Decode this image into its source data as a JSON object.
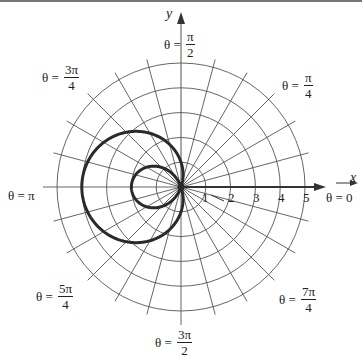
{
  "chart_data": {
    "type": "line",
    "subtype": "polar",
    "title": "",
    "equation": "r = 1 - 3cos(θ)",
    "curve": "limaçon with inner loop",
    "xlabel": "x",
    "ylabel": "y",
    "radial_ticks": [
      "1",
      "2",
      "3",
      "4",
      "5"
    ],
    "rlim": [
      0,
      5
    ],
    "grid": true,
    "grid_circles": [
      1,
      2,
      3,
      4,
      5
    ],
    "grid_radial_step_deg": 15,
    "angle_labels": [
      {
        "key": "zero",
        "text": "θ = 0",
        "num": "",
        "den": ""
      },
      {
        "key": "pi_4",
        "text": "θ =",
        "num": "π",
        "den": "4"
      },
      {
        "key": "pi_2",
        "text": "θ =",
        "num": "π",
        "den": "2"
      },
      {
        "key": "three_pi_4",
        "text": "θ =",
        "num": "3π",
        "den": "4"
      },
      {
        "key": "pi",
        "text": "θ = π",
        "num": "",
        "den": ""
      },
      {
        "key": "five_pi_4",
        "text": "θ =",
        "num": "5π",
        "den": "4"
      },
      {
        "key": "three_pi_2",
        "text": "θ =",
        "num": "3π",
        "den": "2"
      },
      {
        "key": "seven_pi_4",
        "text": "θ =",
        "num": "7π",
        "den": "4"
      }
    ],
    "key_points": [
      {
        "theta": "0",
        "r": -2
      },
      {
        "theta": "π/2",
        "r": 1
      },
      {
        "theta": "π",
        "r": 4
      },
      {
        "theta": "3π/2",
        "r": 1
      }
    ]
  },
  "labels": {
    "x_axis": "x",
    "y_axis": "y",
    "ticks": [
      "1",
      "2",
      "3",
      "4",
      "5"
    ],
    "theta0": "θ = 0",
    "theta_pi": "θ = π",
    "theta_pi_4": {
      "pre": "θ =",
      "num": "π",
      "den": "4"
    },
    "theta_pi_2": {
      "pre": "θ =",
      "num": "π",
      "den": "2"
    },
    "theta_3pi_4": {
      "pre": "θ =",
      "num": "3π",
      "den": "4"
    },
    "theta_5pi_4": {
      "pre": "θ =",
      "num": "5π",
      "den": "4"
    },
    "theta_3pi_2": {
      "pre": "θ =",
      "num": "3π",
      "den": "2"
    },
    "theta_7pi_4": {
      "pre": "θ =",
      "num": "7π",
      "den": "4"
    }
  },
  "colors": {
    "grid": "#555555",
    "curve": "#2a2a2a",
    "axis": "#333333",
    "background": "#ffffff"
  }
}
